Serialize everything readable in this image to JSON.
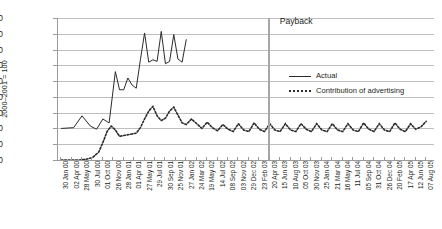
{
  "chart_data": {
    "type": "line",
    "title": "",
    "ylabel_lines": [
      "Sales volume average",
      "2000–2001 = 100"
    ],
    "xlabel": "",
    "ylim": [
      0,
      180
    ],
    "ytick_step": 20,
    "yticks": [
      0,
      20,
      40,
      60,
      80,
      100,
      120,
      140,
      160,
      180
    ],
    "grid": true,
    "legend_position": "center-right",
    "annotations": [
      {
        "text": "Payback",
        "x_label": "23 Feb 03",
        "x_index": 20
      }
    ],
    "categories": [
      "30 Jan 00",
      "02 Apr 00",
      "28 May 00",
      "30 Jul 00",
      "01 Oct 00",
      "26 Nov 00",
      "28 Jan 01",
      "01 Apr 01",
      "27 May 01",
      "29 Jul 01",
      "30 Sep 01",
      "25 Nov 01",
      "27 Jan 02",
      "24 Mar 02",
      "19 May 02",
      "14 Jul 02",
      "08 Sep 02",
      "03 Nov 02",
      "29 Dec 02",
      "23 Feb 03",
      "20 Apr 03",
      "15 Jun 03",
      "10 Aug 03",
      "05 Oct 03",
      "30 Nov 03",
      "25 Jan 04",
      "21 Mar 04",
      "16 May 04",
      "11 Jul 04",
      "05 Sep 04",
      "31 Oct 04",
      "26 Dec 04",
      "20 Feb 05",
      "17 Apr 05",
      "12 Jun 05",
      "07 Aug 05"
    ],
    "series": [
      {
        "name": "Actual",
        "style": "solid",
        "color": "#2b2b2b",
        "x": [
          0,
          1.2,
          2.0,
          2.8,
          3.4,
          4.0,
          4.6,
          5.2,
          5.6,
          6.0,
          6.4,
          6.8,
          7.2,
          7.6,
          8.0,
          8.4,
          8.8,
          9.2,
          9.6,
          10.0,
          10.4,
          10.8,
          11.2,
          11.6,
          12.0
        ],
        "values": [
          40,
          41,
          56,
          43,
          39,
          52,
          47,
          112,
          89,
          89,
          104,
          95,
          91,
          127,
          161,
          124,
          127,
          125,
          163,
          122,
          125,
          159,
          128,
          124,
          153
        ]
      },
      {
        "name": "Contribution of advertising",
        "style": "dotted",
        "color": "#2b2b2b",
        "x": [
          0,
          0.6,
          1.2,
          1.8,
          2.4,
          3.0,
          3.6,
          4.0,
          4.4,
          4.8,
          5.2,
          5.6,
          6.0,
          6.4,
          6.8,
          7.2,
          7.6,
          8.0,
          8.4,
          8.8,
          9.2,
          9.6,
          10.0,
          10.4,
          10.8,
          11.2,
          11.6,
          12.0,
          12.5,
          13.0,
          13.5,
          14.0,
          14.5,
          15.0,
          15.5,
          16.0,
          16.5,
          17.0,
          17.5,
          18.0,
          18.5,
          19.0,
          19.5,
          20.0,
          20.5,
          21.0,
          21.5,
          22.0,
          22.5,
          23.0,
          23.5,
          24.0,
          24.5,
          25.0,
          25.5,
          26.0,
          26.5,
          27.0,
          27.5,
          28.0,
          28.5,
          29.0,
          29.5,
          30.0,
          30.5,
          31.0,
          31.5,
          32.0,
          32.5,
          33.0,
          33.5,
          34.0,
          34.5,
          35.0
        ],
        "values": [
          0,
          0,
          0,
          0,
          1,
          3,
          10,
          22,
          36,
          43,
          38,
          30,
          31,
          32,
          33,
          34,
          41,
          52,
          62,
          68,
          56,
          50,
          53,
          62,
          67,
          57,
          47,
          45,
          52,
          46,
          40,
          48,
          41,
          37,
          45,
          39,
          36,
          46,
          38,
          36,
          47,
          39,
          36,
          46,
          38,
          36,
          46,
          38,
          36,
          46,
          39,
          36,
          46,
          38,
          36,
          46,
          38,
          36,
          46,
          38,
          36,
          47,
          39,
          36,
          46,
          38,
          36,
          47,
          39,
          36,
          46,
          39,
          42,
          49
        ]
      }
    ]
  },
  "legend": {
    "items": [
      {
        "label": "Actual",
        "style": "solid"
      },
      {
        "label": "Contribution of advertising",
        "style": "dotted"
      }
    ]
  },
  "colors": {
    "line": "#2b2b2b",
    "grid": "#bfbfbf",
    "axis": "#9a9a9a",
    "payback_line": "#a6a6a6",
    "background": "#ffffff"
  }
}
